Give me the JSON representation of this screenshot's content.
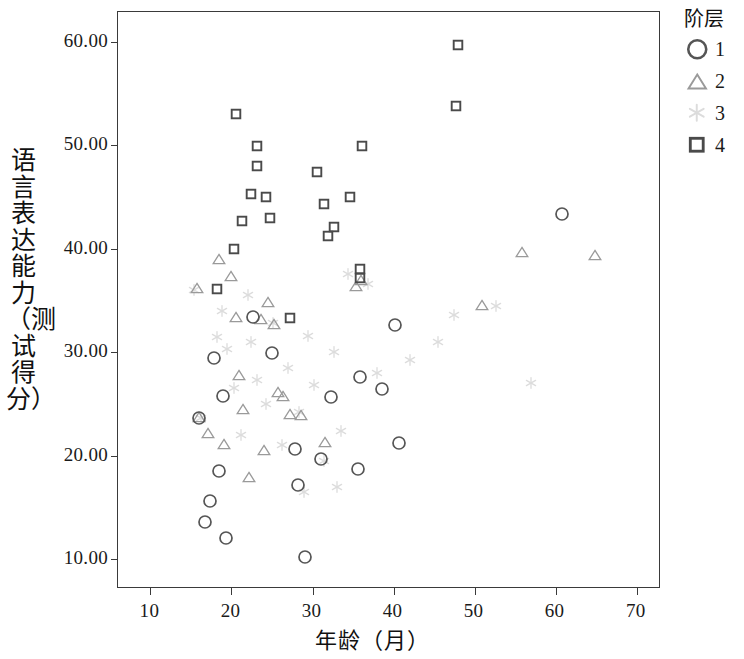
{
  "chart_data": {
    "type": "scatter",
    "title": "",
    "xlabel": "年龄（月）",
    "ylabel": "语言表达能力（测试得分）",
    "xlim": [
      6,
      73
    ],
    "ylim": [
      7.1,
      62.9
    ],
    "xticks": [
      "10",
      "20",
      "30",
      "40",
      "50",
      "60",
      "70"
    ],
    "xtick_values": [
      10,
      20,
      30,
      40,
      50,
      60,
      70
    ],
    "yticks": [
      "10.00",
      "20.00",
      "30.00",
      "40.00",
      "50.00",
      "60.00"
    ],
    "ytick_values": [
      10,
      20,
      30,
      40,
      50,
      60
    ],
    "grid": false,
    "legend_position": "right",
    "legend_title": "阶层",
    "series": [
      {
        "name": "1",
        "marker": "circle",
        "color": "#555555",
        "points": [
          [
            16.0,
            23.6
          ],
          [
            17.8,
            29.4
          ],
          [
            18.4,
            18.5
          ],
          [
            18.9,
            25.8
          ],
          [
            17.4,
            15.6
          ],
          [
            16.7,
            13.6
          ],
          [
            19.3,
            12.0
          ],
          [
            22.6,
            33.4
          ],
          [
            25.0,
            29.9
          ],
          [
            27.8,
            20.6
          ],
          [
            28.2,
            17.2
          ],
          [
            29.1,
            10.2
          ],
          [
            31.0,
            19.7
          ],
          [
            32.3,
            25.7
          ],
          [
            35.6,
            18.7
          ],
          [
            35.8,
            27.6
          ],
          [
            38.6,
            26.4
          ],
          [
            40.7,
            21.2
          ],
          [
            40.2,
            32.6
          ],
          [
            60.8,
            43.4
          ]
        ]
      },
      {
        "name": "2",
        "marker": "triangle",
        "color": "#9a9a9a",
        "points": [
          [
            15.8,
            36.2
          ],
          [
            16.0,
            23.7
          ],
          [
            17.1,
            22.2
          ],
          [
            18.5,
            39.0
          ],
          [
            19.1,
            21.1
          ],
          [
            20.0,
            37.4
          ],
          [
            20.6,
            33.4
          ],
          [
            20.9,
            27.8
          ],
          [
            21.4,
            24.5
          ],
          [
            22.2,
            17.9
          ],
          [
            23.6,
            33.2
          ],
          [
            24.5,
            34.9
          ],
          [
            24.0,
            20.5
          ],
          [
            25.3,
            32.7
          ],
          [
            25.8,
            26.2
          ],
          [
            26.4,
            25.8
          ],
          [
            27.2,
            24.0
          ],
          [
            28.6,
            23.9
          ],
          [
            31.6,
            21.3
          ],
          [
            35.4,
            36.4
          ],
          [
            36.0,
            37.0
          ],
          [
            50.9,
            34.6
          ],
          [
            55.9,
            39.7
          ],
          [
            64.9,
            39.4
          ]
        ]
      },
      {
        "name": "3",
        "marker": "star",
        "color": "#dcdcdc",
        "points": [
          [
            15.4,
            36.0
          ],
          [
            16.3,
            23.6
          ],
          [
            18.2,
            31.5
          ],
          [
            19.4,
            30.3
          ],
          [
            20.3,
            26.5
          ],
          [
            21.2,
            22.0
          ],
          [
            22.4,
            31.0
          ],
          [
            23.1,
            27.3
          ],
          [
            24.3,
            25.0
          ],
          [
            25.1,
            32.8
          ],
          [
            26.2,
            21.0
          ],
          [
            27.0,
            28.5
          ],
          [
            28.3,
            24.2
          ],
          [
            29.4,
            31.6
          ],
          [
            30.2,
            26.8
          ],
          [
            31.4,
            19.5
          ],
          [
            32.6,
            30.0
          ],
          [
            33.5,
            22.4
          ],
          [
            34.4,
            37.6
          ],
          [
            36.8,
            36.6
          ],
          [
            38.0,
            28.0
          ],
          [
            42.0,
            29.2
          ],
          [
            45.5,
            31.0
          ],
          [
            47.5,
            33.6
          ],
          [
            52.6,
            34.5
          ],
          [
            57.0,
            27.0
          ],
          [
            22.0,
            35.5
          ],
          [
            29.0,
            16.5
          ],
          [
            33.0,
            17.0
          ],
          [
            18.8,
            34.0
          ]
        ]
      },
      {
        "name": "4",
        "marker": "square",
        "color": "#4a4a4a",
        "points": [
          [
            18.2,
            36.1
          ],
          [
            20.6,
            53.0
          ],
          [
            21.3,
            42.7
          ],
          [
            20.3,
            40.0
          ],
          [
            23.2,
            49.9
          ],
          [
            23.1,
            48.0
          ],
          [
            22.4,
            45.3
          ],
          [
            24.2,
            45.0
          ],
          [
            24.7,
            43.0
          ],
          [
            27.2,
            33.3
          ],
          [
            30.6,
            47.4
          ],
          [
            31.4,
            44.3
          ],
          [
            31.9,
            41.2
          ],
          [
            32.6,
            42.1
          ],
          [
            34.6,
            45.0
          ],
          [
            36.1,
            49.9
          ],
          [
            35.8,
            38.0
          ],
          [
            35.8,
            37.2
          ],
          [
            47.9,
            59.7
          ],
          [
            47.7,
            53.8
          ]
        ]
      }
    ]
  },
  "legend": {
    "title": "阶层",
    "entries": [
      {
        "label": "1",
        "marker": "circle-icon"
      },
      {
        "label": "2",
        "marker": "triangle-icon"
      },
      {
        "label": "3",
        "marker": "star-icon"
      },
      {
        "label": "4",
        "marker": "square-icon"
      }
    ]
  }
}
